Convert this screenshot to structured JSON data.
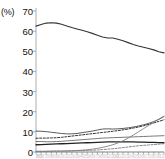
{
  "chart_data": {
    "type": "line",
    "title": "",
    "xlabel": "",
    "ylabel": "",
    "unit_label": "(%)",
    "ylim": [
      0,
      70
    ],
    "yticks": [
      0,
      10,
      20,
      30,
      40,
      50,
      60,
      70
    ],
    "ytick_labels": [
      "0",
      "10",
      "20",
      "30",
      "40",
      "50",
      "60",
      "70"
    ],
    "grid": false,
    "legend": "none",
    "x": [
      0,
      1,
      2,
      3,
      4,
      5,
      6,
      7,
      8,
      9,
      10,
      11,
      12,
      13,
      14,
      15,
      16,
      17,
      18,
      19,
      20,
      21,
      22,
      23,
      24,
      25
    ],
    "xtick_labels_cropped": true,
    "xtick_labels": [
      "1985",
      "86",
      "87",
      "88",
      "89",
      "90",
      "91",
      "92",
      "93",
      "94",
      "95",
      "96",
      "97",
      "98",
      "99",
      "2000",
      "01",
      "02",
      "03",
      "04",
      "05",
      "06",
      "07",
      "08",
      "09",
      "10"
    ],
    "series": [
      {
        "name": "series-1-top",
        "style": "solid",
        "width": 1.1,
        "color": "#333333",
        "values": [
          62.5,
          63.3,
          64.0,
          64.2,
          64.0,
          63.4,
          62.6,
          61.8,
          61.1,
          60.4,
          59.7,
          58.9,
          58.0,
          57.1,
          56.6,
          56.6,
          56.0,
          55.2,
          54.3,
          53.4,
          52.6,
          52.0,
          51.4,
          50.7,
          49.8,
          49.2
        ]
      },
      {
        "name": "series-2",
        "style": "solid",
        "width": 0.9,
        "color": "#4a4a4a",
        "values": [
          10.4,
          10.3,
          10.1,
          9.8,
          9.5,
          9.2,
          9.0,
          9.0,
          9.2,
          9.6,
          10.0,
          10.4,
          10.9,
          11.4,
          11.5,
          11.4,
          11.5,
          11.7,
          12.0,
          12.4,
          12.9,
          13.5,
          14.2,
          15.1,
          16.2,
          17.6
        ]
      },
      {
        "name": "series-3",
        "style": "dashed",
        "width": 1.0,
        "color": "#333333",
        "values": [
          6.8,
          6.9,
          6.9,
          7.0,
          7.1,
          7.3,
          7.6,
          7.9,
          8.2,
          8.5,
          8.8,
          9.1,
          9.4,
          9.7,
          10.0,
          10.3,
          10.6,
          11.0,
          11.4,
          11.9,
          12.4,
          13.0,
          13.7,
          14.4,
          15.2,
          16.0
        ]
      },
      {
        "name": "series-4",
        "style": "solid",
        "width": 0.9,
        "color": "#6a6a6a",
        "values": [
          5.2,
          5.2,
          5.1,
          5.1,
          5.2,
          5.3,
          5.5,
          5.7,
          5.9,
          6.1,
          6.3,
          6.5,
          6.7,
          6.9,
          7.0,
          7.1,
          7.2,
          7.3,
          7.4,
          7.5,
          7.6,
          7.7,
          7.8,
          7.9,
          8.0,
          8.1
        ]
      },
      {
        "name": "series-5",
        "style": "solid",
        "width": 1.3,
        "color": "#222222",
        "values": [
          3.6,
          3.7,
          3.8,
          3.9,
          4.0,
          4.1,
          4.2,
          4.3,
          4.4,
          4.5,
          4.6,
          4.7,
          4.8,
          4.9,
          5.0,
          5.0,
          5.0,
          5.0,
          5.0,
          5.0,
          4.9,
          4.9,
          4.8,
          4.8,
          4.7,
          4.6
        ]
      },
      {
        "name": "series-6-low",
        "style": "dashed",
        "width": 0.9,
        "color": "#777777",
        "values": [
          0.4,
          0.4,
          0.4,
          0.5,
          0.5,
          0.5,
          0.6,
          0.6,
          0.7,
          0.7,
          0.8,
          0.9,
          1.0,
          1.2,
          1.4,
          1.6,
          1.9,
          2.2,
          2.5,
          2.8,
          3.1,
          3.3,
          3.5,
          3.7,
          3.9,
          4.1
        ]
      },
      {
        "name": "series-7-rising",
        "style": "solid",
        "width": 0.9,
        "color": "#808080",
        "values": [
          0.2,
          0.2,
          0.3,
          0.3,
          0.4,
          0.4,
          0.5,
          0.6,
          0.7,
          0.9,
          1.1,
          1.4,
          1.8,
          2.3,
          2.9,
          3.6,
          4.5,
          5.6,
          6.9,
          8.4,
          10.0,
          11.6,
          13.2,
          14.8,
          16.3,
          17.8
        ]
      }
    ]
  }
}
